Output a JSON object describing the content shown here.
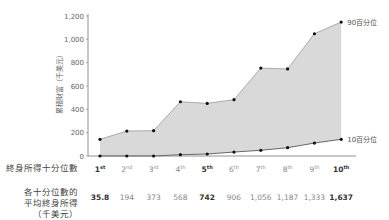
{
  "chart_data": {
    "type": "area",
    "title": "",
    "ylabel": "累積財富（千美元）",
    "xlabel": "終身所得十分位數",
    "ylim": [
      0,
      1200
    ],
    "yticks": [
      "0",
      "200",
      "400",
      "600",
      "800",
      "1,000",
      "1,200"
    ],
    "grid": false,
    "categories": [
      "1st",
      "2nd",
      "3rd",
      "4th",
      "5th",
      "6th",
      "7th",
      "8th",
      "9th",
      "10th"
    ],
    "series": [
      {
        "name": "90百分位",
        "values": [
          143,
          214,
          217,
          465,
          451,
          483,
          754,
          746,
          1048,
          1148
        ]
      },
      {
        "name": "10百分位",
        "values": [
          0,
          0,
          0,
          11,
          17,
          34,
          49,
          71,
          111,
          143
        ]
      }
    ],
    "fill_between": [
      "90百分位",
      "10百分位"
    ],
    "fill_color": "#d9d9d9",
    "line_color": "#999999",
    "marker_color": "#111111",
    "annotations": [
      "90百分位",
      "10百分位"
    ],
    "table_row": {
      "label": "各十分位數的平均終身所得（千美元）",
      "values": [
        "35.8",
        "194",
        "373",
        "568",
        "742",
        "906",
        "1,056",
        "1,187",
        "1,333",
        "1,637"
      ],
      "bold_indices": [
        0,
        4,
        9
      ]
    }
  },
  "labels": {
    "ylabel": "累積財富（千美元）",
    "decile_row": "終身所得十分位數",
    "income_row_line1": "各十分位數的",
    "income_row_line2": "平均終身所得",
    "income_row_line3": "（千美元）",
    "p90": "90百分位",
    "p10": "10百分位"
  },
  "deciles": [
    {
      "num": "1",
      "sup": "st"
    },
    {
      "num": "2",
      "sup": "nd"
    },
    {
      "num": "3",
      "sup": "rd"
    },
    {
      "num": "4",
      "sup": "th"
    },
    {
      "num": "5",
      "sup": "th"
    },
    {
      "num": "6",
      "sup": "th"
    },
    {
      "num": "7",
      "sup": "th"
    },
    {
      "num": "8",
      "sup": "th"
    },
    {
      "num": "9",
      "sup": "th"
    },
    {
      "num": "10",
      "sup": "th"
    }
  ],
  "incomes": [
    "35.8",
    "194",
    "373",
    "568",
    "742",
    "906",
    "1,056",
    "1,187",
    "1,333",
    "1,637"
  ]
}
